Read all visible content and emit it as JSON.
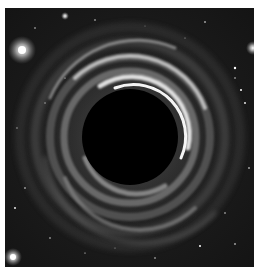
{
  "image": {
    "subject": "black hole with swirling accretion disk on a starfield",
    "palette": {
      "background": "#ffffff",
      "space": "#181818",
      "ring_light": "#e6e6e6",
      "ring_mid": "#8a8a8a",
      "event_horizon": "#000000",
      "star": "#ffffff"
    },
    "event_horizon": {
      "cx": 125,
      "cy": 129,
      "r": 48
    },
    "bright_stars": [
      {
        "x": 17,
        "y": 42,
        "r": 5
      },
      {
        "x": 8,
        "y": 249,
        "r": 4
      },
      {
        "x": 60,
        "y": 8,
        "r": 2
      },
      {
        "x": 248,
        "y": 40,
        "r": 3
      }
    ]
  }
}
